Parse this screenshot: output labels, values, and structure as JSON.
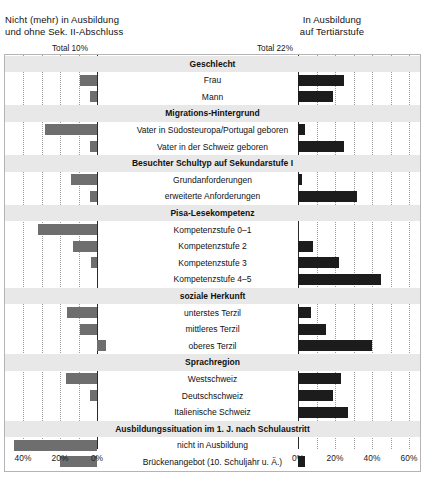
{
  "titles": {
    "left": "Nicht (mehr) in Ausbildung\nund ohne Sek. II-Abschluss",
    "right": "In Ausbildung\nauf Tertiärstufe"
  },
  "totals": {
    "left": "Total 10%",
    "right": "Total 22%"
  },
  "axes": {
    "left_ticks": [
      "40%",
      "20%",
      "0%"
    ],
    "right_ticks": [
      "0%",
      "20%",
      "40%",
      "60%"
    ]
  },
  "chart_data": {
    "type": "bar",
    "orientation": "horizontal",
    "grid": true,
    "legend": "none",
    "panels": [
      {
        "name": "left",
        "title": "Nicht (mehr) in Ausbildung und ohne Sek. II-Abschluss",
        "reference": "Total 10%",
        "xlabel": "",
        "ylabel": "",
        "xlim": [
          0,
          50
        ],
        "direction": "left",
        "ticks": [
          40,
          20,
          0
        ],
        "color": "#6e6e6e"
      },
      {
        "name": "right",
        "title": "In Ausbildung auf Tertiärstufe",
        "reference": "Total 22%",
        "xlabel": "",
        "ylabel": "",
        "xlim": [
          0,
          65
        ],
        "direction": "right",
        "ticks": [
          0,
          20,
          40,
          60
        ],
        "color": "#1c1c1c"
      }
    ],
    "categories": [
      "Geschlecht",
      "Frau",
      "Mann",
      "Migrations-Hintergrund",
      "Vater in Südosteuropa/Portugal geboren",
      "Vater in der Schweiz geboren",
      "Besuchter Schultyp auf Sekundarstufe I",
      "Grundanforderungen",
      "erweiterte Anforderungen",
      "Pisa-Lesekompetenz",
      "Kompetenzstufe 0–1",
      "Kompetenzstufe 2",
      "Kompetenzstufe 3",
      "Kompetenzstufe 4–5",
      "soziale Herkunft",
      "unterstes Terzil",
      "mittleres Terzil",
      "oberes Terzil",
      "Sprachregion",
      "Westschweiz",
      "Deutschschweiz",
      "Italienische Schweiz",
      "Ausbildungssituation im 1. J. nach Schulaustritt",
      "nicht in Ausbildung",
      "Brückenangebot (10. Schuljahr u. Ä.)",
      "Berufsbildung, hohes Anforderungsniveau",
      "Berufsbildung, tiefes/mittleres Anforderungsniveau",
      "Allgemeinbildung",
      "Urbanisierungsgrad",
      "Stadt/Agglomeration",
      "Land"
    ],
    "rows": [
      {
        "label": "Geschlecht",
        "header": true,
        "left": null,
        "right": null
      },
      {
        "label": "Frau",
        "header": false,
        "left_start": 0,
        "left_end": 9,
        "right_start": 0,
        "right_end": 25
      },
      {
        "label": "Mann",
        "header": false,
        "left_start": 0,
        "left_end": 4,
        "right_start": 0,
        "right_end": 19
      },
      {
        "label": "Migrations-Hintergrund",
        "header": true,
        "left": null,
        "right": null
      },
      {
        "label": "Vater in Südosteuropa/Portugal geboren",
        "header": false,
        "left_start": 0,
        "left_end": 28,
        "right_start": 0,
        "right_end": 4
      },
      {
        "label": "Vater in der Schweiz geboren",
        "header": false,
        "left_start": 0,
        "left_end": 4,
        "right_start": 0,
        "right_end": 25
      },
      {
        "label": "Besuchter Schultyp auf Sekundarstufe I",
        "header": true,
        "left": null,
        "right": null
      },
      {
        "label": "Grundanforderungen",
        "header": false,
        "left_start": 0,
        "left_end": 14,
        "right_start": 0,
        "right_end": 2
      },
      {
        "label": "erweiterte Anforderungen",
        "header": false,
        "left_start": 0,
        "left_end": 4,
        "right_start": 0,
        "right_end": 32
      },
      {
        "label": "Pisa-Lesekompetenz",
        "header": true,
        "left": null,
        "right": null
      },
      {
        "label": "Kompetenzstufe 0–1",
        "header": false,
        "left_start": 0,
        "left_end": 32,
        "right_start": 0,
        "right_end": 0
      },
      {
        "label": "Kompetenzstufe 2",
        "header": false,
        "left_start": 0,
        "left_end": 13,
        "right_start": 0,
        "right_end": 8
      },
      {
        "label": "Kompetenzstufe 3",
        "header": false,
        "left_start": 0,
        "left_end": 3,
        "right_start": 0,
        "right_end": 22
      },
      {
        "label": "Kompetenzstufe 4–5",
        "header": false,
        "left_start": 0,
        "left_end": 0,
        "right_start": 0,
        "right_end": 45
      },
      {
        "label": "soziale Herkunft",
        "header": true,
        "left": null,
        "right": null
      },
      {
        "label": "unterstes Terzil",
        "header": false,
        "left_start": 0,
        "left_end": 16,
        "right_start": 0,
        "right_end": 7
      },
      {
        "label": "mittleres Terzil",
        "header": false,
        "left_start": 0,
        "left_end": 9,
        "right_start": 0,
        "right_end": 15
      },
      {
        "label": "oberes Terzil",
        "header": false,
        "left_start": -5,
        "left_end": 0,
        "right_start": 0,
        "right_end": 40
      },
      {
        "label": "Sprachregion",
        "header": true,
        "left": null,
        "right": null
      },
      {
        "label": "Westschweiz",
        "header": false,
        "left_start": 0,
        "left_end": 17,
        "right_start": 0,
        "right_end": 23
      },
      {
        "label": "Deutschschweiz",
        "header": false,
        "left_start": 0,
        "left_end": 4,
        "right_start": 0,
        "right_end": 19
      },
      {
        "label": "Italienische Schweiz",
        "header": false,
        "left_start": 0,
        "left_end": 0,
        "right_start": 0,
        "right_end": 27
      },
      {
        "label": "Ausbildungssituation im 1. J. nach Schulaustritt",
        "header": true,
        "left": null,
        "right": null
      },
      {
        "label": "nicht in Ausbildung",
        "header": false,
        "left_start": 0,
        "left_end": 45,
        "right_start": 0,
        "right_end": 0
      },
      {
        "label": "Brückenangebot (10. Schuljahr u. Ä.)",
        "header": false,
        "left_start": 0,
        "left_end": 20,
        "right_start": 0,
        "right_end": 4
      },
      {
        "label": "Berufsbildung, hohes Anforderungsniveau",
        "header": false,
        "left_start": 0,
        "left_end": 12,
        "right_start": 0,
        "right_end": 12
      },
      {
        "label": "Berufsbildung, tiefes/mittleres Anforderungsniveau",
        "header": false,
        "left_start": 0,
        "left_end": 10,
        "right_start": 0,
        "right_end": 2
      },
      {
        "label": "Allgemeinbildung",
        "header": false,
        "left_start": 0,
        "left_end": 0,
        "right_start": 0,
        "right_end": 60
      },
      {
        "label": "Urbanisierungsgrad",
        "header": true,
        "left": null,
        "right": null
      },
      {
        "label": "Stadt/Agglomeration",
        "header": false,
        "left_start": 0,
        "left_end": 5,
        "right_start": 0,
        "right_end": 25
      },
      {
        "label": "Land",
        "header": false,
        "left_start": 0,
        "left_end": 4,
        "right_start": 0,
        "right_end": 19
      }
    ]
  }
}
